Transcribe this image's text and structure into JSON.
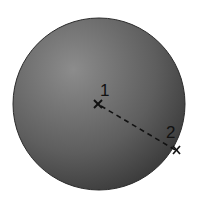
{
  "diagram": {
    "type": "sphere-with-points",
    "sphere": {
      "cx": 99,
      "cy": 104,
      "r": 86,
      "fill_light": "#8a8a8a",
      "fill_dark": "#3a3a3a",
      "edge": "#2a2a2a"
    },
    "points": [
      {
        "label": "1",
        "x": 98,
        "y": 104,
        "label_x": 101,
        "label_y": 95,
        "marker": "x"
      },
      {
        "label": "2",
        "x": 177,
        "y": 150,
        "label_x": 166,
        "label_y": 138,
        "marker": "x"
      }
    ],
    "connector": {
      "from": "1",
      "to": "2",
      "style": "dashed",
      "color": "#111111"
    }
  }
}
